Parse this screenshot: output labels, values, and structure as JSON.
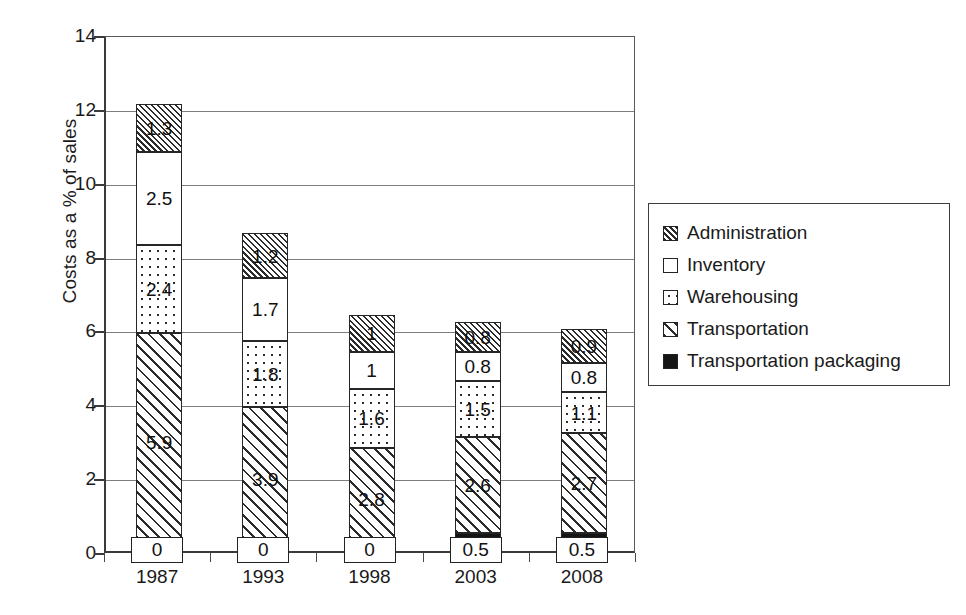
{
  "chart_data": {
    "type": "bar",
    "subtype": "stacked-vertical",
    "title": "",
    "xlabel": "",
    "ylabel": "Costs as a % of sales",
    "ylim": [
      0,
      14
    ],
    "ytick_step": 2,
    "yticks": [
      "0",
      "2",
      "4",
      "6",
      "8",
      "10",
      "12",
      "14"
    ],
    "grid": true,
    "grid_axis": "y",
    "legend_position": "right",
    "categories": [
      "1987",
      "1993",
      "1998",
      "2003",
      "2008"
    ],
    "stack_order_bottom_to_top": [
      "Transportation packaging",
      "Transportation",
      "Warehousing",
      "Inventory",
      "Administration"
    ],
    "series": [
      {
        "name": "Transportation packaging",
        "pattern": "solid-black",
        "values": [
          0,
          0,
          0,
          0.5,
          0.5
        ],
        "labels": [
          "0",
          "0",
          "0",
          "0.5",
          "0.5"
        ]
      },
      {
        "name": "Transportation",
        "pattern": "diagonal-hatch-wide",
        "values": [
          5.9,
          3.9,
          2.8,
          2.6,
          2.7
        ],
        "labels": [
          "5.9",
          "3.9",
          "2.8",
          "2.6",
          "2.7"
        ]
      },
      {
        "name": "Warehousing",
        "pattern": "dots",
        "values": [
          2.4,
          1.8,
          1.6,
          1.5,
          1.1
        ],
        "labels": [
          "2.4",
          "1.8",
          "1.6",
          "1.5",
          "1.1"
        ]
      },
      {
        "name": "Inventory",
        "pattern": "white",
        "values": [
          2.5,
          1.7,
          1,
          0.8,
          0.8
        ],
        "labels": [
          "2.5",
          "1.7",
          "1",
          "0.8",
          "0.8"
        ]
      },
      {
        "name": "Administration",
        "pattern": "diagonal-hatch-fine",
        "values": [
          1.3,
          1.2,
          1,
          0.8,
          0.9
        ],
        "labels": [
          "1.3",
          "1.2",
          "1",
          "0.8",
          "0.9"
        ]
      }
    ],
    "totals": [
      12.1,
      8.6,
      6.4,
      6.2,
      6.0
    ]
  },
  "legend": {
    "items": [
      {
        "label": "Administration",
        "pattern": "diagonal-hatch-fine"
      },
      {
        "label": "Inventory",
        "pattern": "white"
      },
      {
        "label": "Warehousing",
        "pattern": "dots"
      },
      {
        "label": "Transportation",
        "pattern": "diagonal-hatch-wide"
      },
      {
        "label": "Transportation packaging",
        "pattern": "solid-black"
      }
    ]
  },
  "colors": {
    "ink": "#222222",
    "grid": "#7d7d7d",
    "axis": "#3a3a3a",
    "background": "#ffffff"
  }
}
